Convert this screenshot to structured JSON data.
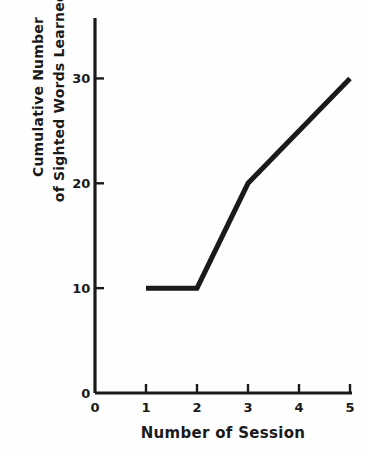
{
  "figure": {
    "background_color": "#fefefe",
    "ink_color": "#1a1a1a"
  },
  "chart_data": {
    "type": "line",
    "title": "",
    "xlabel": "Number of Session",
    "ylabel": "Cumulative Number of Sighted Words Learned",
    "ylabel_lines": [
      "Cumulative Number",
      "of Sighted Words Learned"
    ],
    "x": [
      1,
      2,
      3,
      5
    ],
    "values": [
      10,
      10,
      20,
      30
    ],
    "series": [
      {
        "name": "Cumulative words learned",
        "points": [
          {
            "x": 1,
            "y": 10
          },
          {
            "x": 2,
            "y": 10
          },
          {
            "x": 3,
            "y": 20
          },
          {
            "x": 5,
            "y": 30
          }
        ],
        "color": "#1a1a1a",
        "line_width": 5
      }
    ],
    "xlim": [
      0,
      5
    ],
    "ylim": [
      0,
      35
    ],
    "xticks": [
      0,
      1,
      2,
      3,
      4,
      5
    ],
    "xtick_labels": [
      "0",
      "1",
      "2",
      "3",
      "4",
      "5"
    ],
    "yticks": [
      0,
      10,
      20,
      30
    ],
    "ytick_labels": [
      "0",
      "10",
      "20",
      "30"
    ],
    "grid": false,
    "legend": false,
    "legend_position": "none",
    "markers": false,
    "annotations": []
  }
}
